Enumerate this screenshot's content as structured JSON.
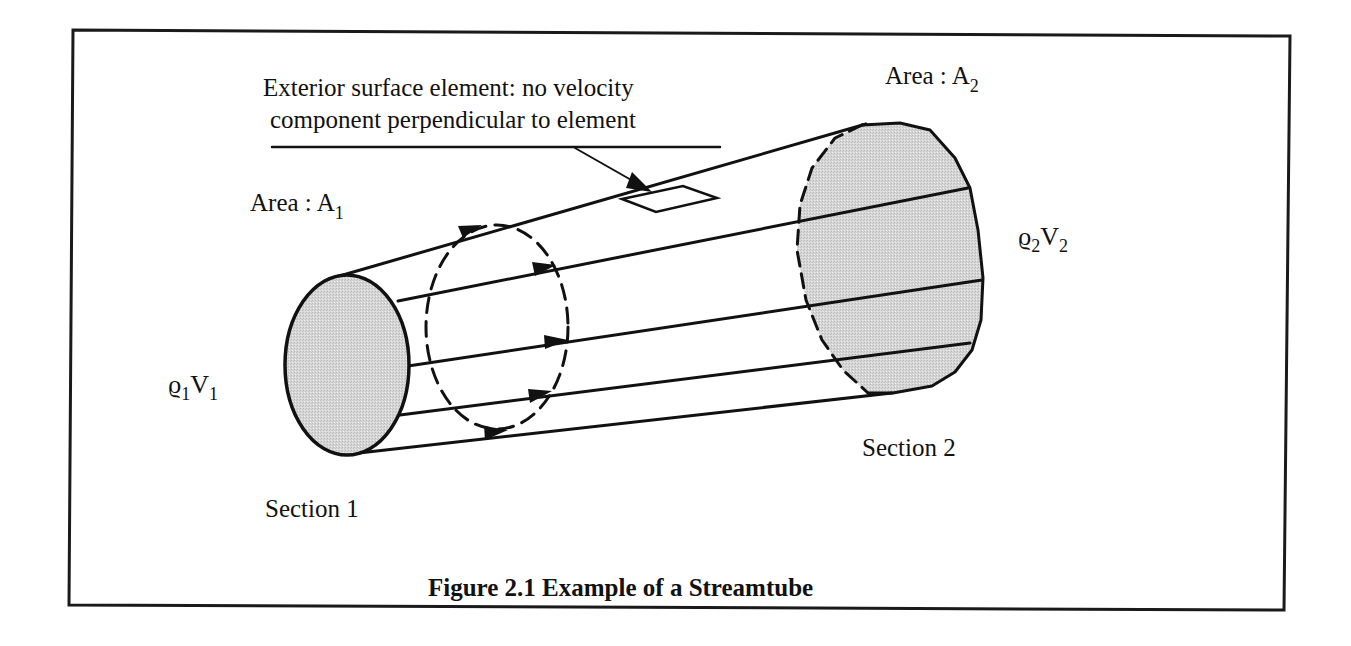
{
  "figure": {
    "caption": "Figure 2.1 Example of a Streamtube",
    "frame": {
      "border_color": "#1a1a1a",
      "background": "#ffffff"
    }
  },
  "labels": {
    "annotation_line1": "Exterior surface element: no velocity",
    "annotation_line2": "component perpendicular to element",
    "area1_prefix": "Area :  A",
    "area1_sub": "1",
    "area2_prefix": "Area :  A",
    "area2_sub": "2",
    "inflow_rho": "ϱ",
    "inflow_rho_sub": "1",
    "inflow_v": "V",
    "inflow_v_sub": "1",
    "outflow_rho": "ϱ",
    "outflow_rho_sub": "2",
    "outflow_v": "V",
    "outflow_v_sub": "2",
    "section1": "Section 1",
    "section2": "Section 2"
  },
  "colors": {
    "ink": "#111111",
    "section_fill": "#d4d4d4"
  },
  "diagram": {
    "sections": [
      {
        "name": "Section 1",
        "shape": "ellipse",
        "fill": "shaded",
        "cx": 347,
        "cy": 365,
        "rx": 62,
        "ry": 90
      },
      {
        "name": "intermediate",
        "shape": "ellipse",
        "style": "dashed",
        "cx": 497,
        "cy": 327,
        "rx": 72,
        "ry": 103
      },
      {
        "name": "Section 2",
        "shape": "ellipse",
        "fill": "shaded",
        "back_edge": "dashed"
      }
    ],
    "streamlines": 5,
    "flow_direction": "left-to-right"
  }
}
